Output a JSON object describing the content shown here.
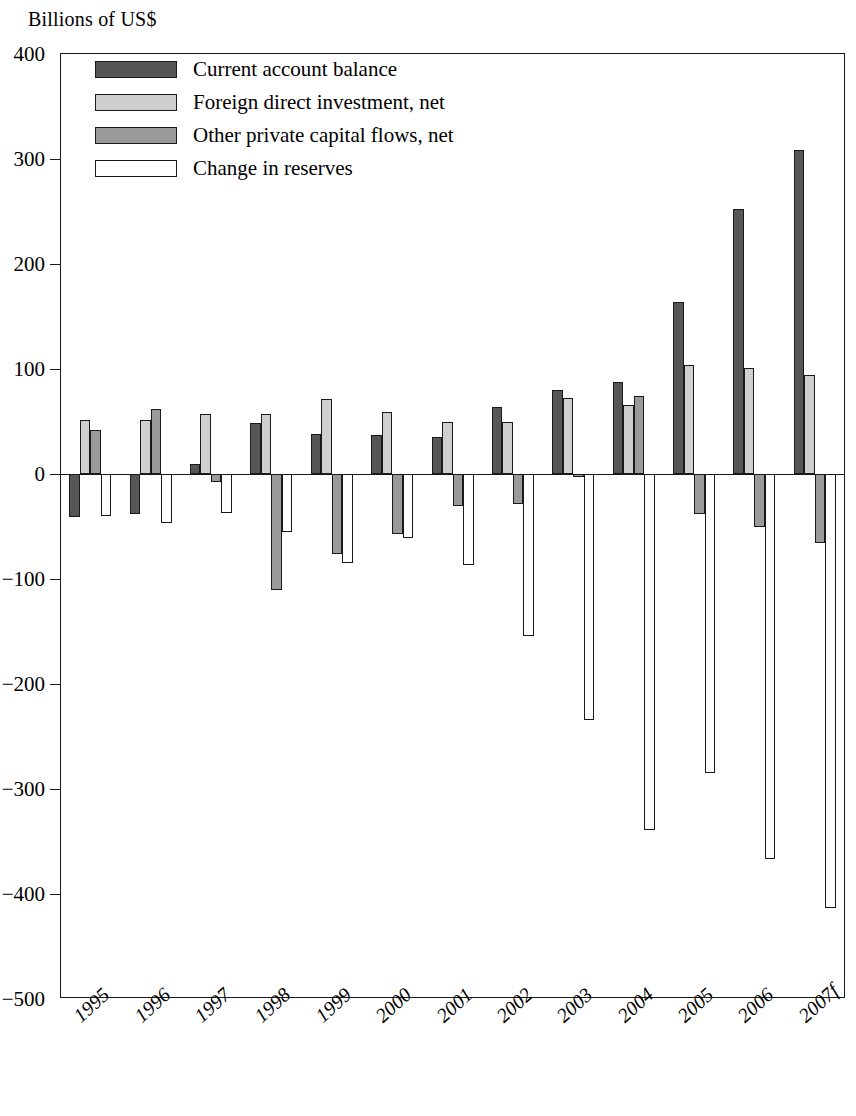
{
  "chart_data": {
    "type": "bar",
    "title": "",
    "subtitle": "",
    "ylabel": "Billions of US$",
    "xlabel": "",
    "ylim": [
      -500,
      400
    ],
    "yticks": [
      400,
      300,
      200,
      100,
      0,
      -100,
      -200,
      -300,
      -400,
      -500
    ],
    "ytick_labels": [
      "400",
      "300",
      "200",
      "100",
      "0",
      "−100",
      "−200",
      "−300",
      "−400",
      "−500"
    ],
    "grid": false,
    "legend_position": "top-left",
    "categories": [
      "1995",
      "1996",
      "1997",
      "1998",
      "1999",
      "2000",
      "2001",
      "2002",
      "2003",
      "2004",
      "2005",
      "2006",
      "2007f"
    ],
    "series": [
      {
        "name": "Current account balance",
        "color": "#565656",
        "values": [
          -41,
          -38,
          10,
          49,
          38,
          37,
          35,
          64,
          80,
          88,
          164,
          252,
          309
        ]
      },
      {
        "name": "Foreign direct investment, net",
        "color": "#cfcfcf",
        "values": [
          51,
          51,
          57,
          57,
          71,
          59,
          50,
          50,
          72,
          66,
          104,
          101,
          94
        ]
      },
      {
        "name": "Other private capital flows, net",
        "color": "#9a9a9a",
        "values": [
          42,
          62,
          -8,
          -110,
          -76,
          -57,
          -30,
          -29,
          -3,
          74,
          -38,
          -50,
          -66
        ]
      },
      {
        "name": "Change in reserves",
        "color": "#ffffff",
        "values": [
          -40,
          -47,
          -37,
          -55,
          -85,
          -61,
          -87,
          -154,
          -234,
          -339,
          -285,
          -367,
          -413
        ]
      }
    ]
  },
  "legend": {
    "items": [
      {
        "label": "Current account balance",
        "swatch": "#565656"
      },
      {
        "label": "Foreign direct investment, net",
        "swatch": "#cfcfcf"
      },
      {
        "label": "Other private capital flows, net",
        "swatch": "#9a9a9a"
      },
      {
        "label": "Change in reserves",
        "swatch": "#ffffff"
      }
    ]
  }
}
